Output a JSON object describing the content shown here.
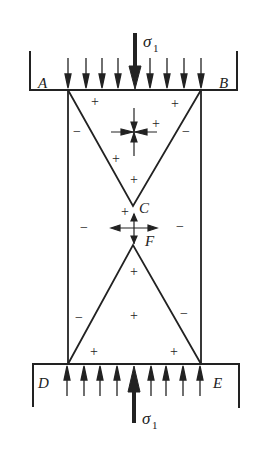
{
  "diagram": {
    "labels": {
      "A": "A",
      "B": "B",
      "C": "C",
      "D": "D",
      "E": "E",
      "F": "F"
    },
    "load_top": {
      "symbol": "σ",
      "subscript": "1"
    },
    "load_bottom": {
      "symbol": "σ",
      "subscript": "1"
    },
    "signs": {
      "plus": "+",
      "minus": "−"
    },
    "colors": {
      "line": "#222222",
      "background": "#ffffff"
    }
  }
}
